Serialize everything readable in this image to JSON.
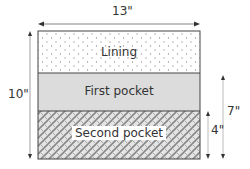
{
  "diagram": {
    "width_label": "13\"",
    "height_label": "10\"",
    "first_pocket_height_label": "7\"",
    "second_pocket_height_label": "4\"",
    "sections": [
      {
        "label": "Lining",
        "fill": "dotted",
        "color": "#ffffff"
      },
      {
        "label": "First pocket",
        "fill": "solid",
        "color": "#dcdcdc"
      },
      {
        "label": "Second pocket",
        "fill": "crosshatch",
        "color": "#c8c8c8"
      }
    ]
  }
}
